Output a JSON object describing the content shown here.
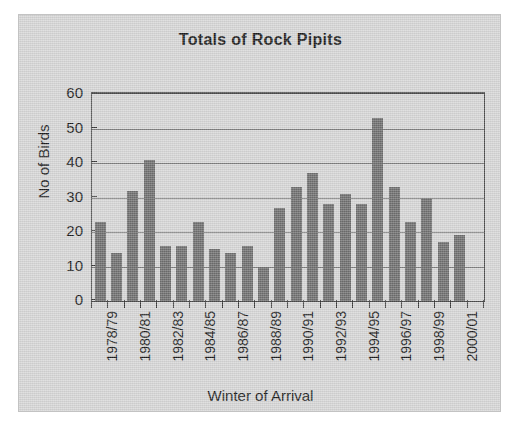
{
  "chart_data": {
    "type": "bar",
    "title": "Totals of Rock Pipits",
    "xlabel": "Winter of Arrival",
    "ylabel": "No of Birds",
    "ylim": [
      0,
      60
    ],
    "ytick_values": [
      60,
      50,
      40,
      30,
      20,
      10,
      0
    ],
    "ytick_labels": [
      "60",
      "50",
      "40",
      "30",
      "20",
      "10",
      "0"
    ],
    "grid": true,
    "legend": false,
    "categories": [
      "1978/79",
      "1979/80",
      "1980/81",
      "1981/82",
      "1982/83",
      "1983/84",
      "1984/85",
      "1985/86",
      "1986/87",
      "1987/88",
      "1988/89",
      "1989/90",
      "1990/91",
      "1991/92",
      "1992/93",
      "1993/94",
      "1994/95",
      "1995/96",
      "1996/97",
      "1997/98",
      "1998/99",
      "1999/00",
      "2000/01",
      "2001/02"
    ],
    "values": [
      23,
      14,
      32,
      41,
      16,
      16,
      23,
      15,
      14,
      16,
      10,
      27,
      33,
      37,
      28,
      31,
      28,
      53,
      33,
      23,
      30,
      17,
      19,
      0
    ],
    "visible_xtick_labels": [
      "1978/79",
      "1980/81",
      "1982/83",
      "1984/85",
      "1986/87",
      "1988/89",
      "1990/91",
      "1992/93",
      "1994/95",
      "1996/97",
      "1998/99",
      "2000/01"
    ],
    "bar_color": "#6e6e6e",
    "plot_background": "#d6d6d6",
    "axis_color": "#4a4a4a",
    "gridline_color": "#7d7d7d"
  }
}
